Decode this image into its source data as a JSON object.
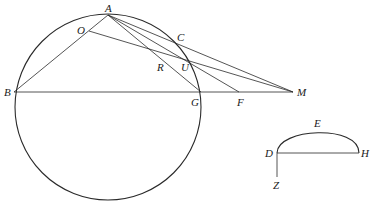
{
  "figure": {
    "type": "geometry-diagram",
    "circle": {
      "cx": 108,
      "cy": 107,
      "r": 93
    },
    "points": {
      "A": {
        "label": "A",
        "x": 108,
        "y": 15
      },
      "B": {
        "label": "B",
        "x": 14,
        "y": 92
      },
      "C": {
        "label": "C",
        "x": 175,
        "y": 40
      },
      "O": {
        "label": "O",
        "x": 89,
        "y": 31
      },
      "R": {
        "label": "R",
        "x": 160,
        "y": 69
      },
      "U": {
        "label": "U",
        "x": 182,
        "y": 69
      },
      "G": {
        "label": "G",
        "x": 201,
        "y": 92
      },
      "F": {
        "label": "F",
        "x": 239,
        "y": 92
      },
      "M": {
        "label": "M",
        "x": 293,
        "y": 92
      },
      "D": {
        "label": "D",
        "x": 277,
        "y": 153
      },
      "E": {
        "label": "E",
        "x": 316,
        "y": 129
      },
      "H": {
        "label": "H",
        "x": 359,
        "y": 153
      },
      "Z": {
        "label": "Z",
        "x": 277,
        "y": 183
      }
    },
    "segments": [
      "AB",
      "AO?",
      "OM",
      "AG",
      "AF",
      "AM",
      "BM",
      "DH",
      "DZ"
    ],
    "arcs": [
      "circle ABG",
      "arc DEH"
    ]
  }
}
